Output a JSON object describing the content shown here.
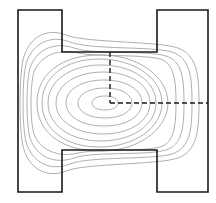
{
  "figure": {
    "title": "",
    "background_color": "#ffffff"
  },
  "domain": {
    "name": "h-shaped-specimen",
    "shape": "H",
    "outline_color": "#1a1a1a",
    "outline_width": 1.6,
    "fill_color": "#ffffff",
    "bounds": {
      "x_min": 18,
      "x_max": 208,
      "y_min": 10,
      "y_max": 192
    },
    "notch": {
      "left_arm_inner_x": 62,
      "right_arm_inner_x": 157,
      "top_notch_y": 52,
      "bottom_notch_y": 150
    },
    "outline_path": "M18,10 L62,10 L62,52 L157,52 L157,10 L208,10 L208,192 L157,192 L157,150 L62,150 L62,192 L18,192 Z"
  },
  "centerlines": {
    "name": "dashed-centerlines",
    "color": "#1a1a1a",
    "width": 1.4,
    "dash_pattern": "5,3",
    "vertical": {
      "x": 110,
      "y_start": 52,
      "y_end": 103
    },
    "horizontal": {
      "y": 103,
      "x_start": 110,
      "x_end": 208
    }
  },
  "chart_data": {
    "type": "contour",
    "title": "",
    "xlabel": "",
    "ylabel": "",
    "grid": false,
    "legend": false,
    "center": {
      "x": 105,
      "y": 103
    },
    "n_levels": 11,
    "level_values": [
      1,
      2,
      3,
      4,
      5,
      6,
      7,
      8,
      9,
      10,
      11
    ],
    "line_color": "#9a9a9a",
    "line_width": 0.8,
    "contours": [
      {
        "level": 11,
        "path": "M105,96 C113,96 118,99 118,103 C118,107 113,110 105,110 C97,110 92,107 92,103 C92,99 97,96 105,96 Z"
      },
      {
        "level": 10,
        "path": "M105,88 C122,88 132,95 132,103 C132,111 122,118 105,118 C88,118 78,111 78,103 C78,95 88,88 105,88 Z"
      },
      {
        "level": 9,
        "path": "M104,80 C127,80 142,90 142,103 C142,116 127,126 104,126 C81,126 66,116 66,103 C66,90 81,80 104,80 Z"
      },
      {
        "level": 8,
        "path": "M103,72 C130,72 150,85 150,103 C150,121 130,134 103,134 C76,134 56,121 56,103 C56,85 76,72 103,72 Z"
      },
      {
        "level": 7,
        "path": "M101,65 C132,65 156,81 156,103 C156,125 132,141 101,141 C70,141 48,125 48,103 C48,81 70,65 101,65 Z"
      },
      {
        "level": 6,
        "path": "M99,59 C134,59 162,78 162,103 C162,128 134,147 99,147 C64,147 42,128 42,103 C42,78 64,59 99,59 Z"
      },
      {
        "level": 5,
        "path": "M95,55 C136,53 168,76 168,103 C168,130 136,153 95,151 C58,149 37,130 37,103 C37,76 58,57 95,55 Z"
      },
      {
        "level": 4,
        "path": "M78,53 C58,48 40,56 34,72 C30,84 30,122 34,134 C40,150 58,158 78,153 C96,149 140,152 160,147 C174,143 176,126 176,103 C176,80 174,63 160,59 C140,54 96,57 78,53 Z"
      },
      {
        "level": 3,
        "path": "M74,48 C54,41 36,50 30,68 C26,82 26,124 30,138 C36,156 54,165 74,158 C94,151 146,156 166,150 C182,145 184,128 184,103 C184,78 182,61 166,56 C146,50 94,55 74,48 Z"
      },
      {
        "level": 2,
        "path": "M70,42 C50,34 32,44 26,64 C22,80 22,126 26,142 C32,162 50,172 70,164 C90,156 152,160 172,154 C190,148 192,130 192,103 C192,76 190,58 172,52 C152,46 90,50 70,42 Z"
      },
      {
        "level": 1,
        "path": "M66,35 C46,27 28,38 23,60 C19,78 19,128 23,146 C28,168 46,179 66,171 C86,163 158,165 178,158 C197,151 199,131 199,103 C199,75 197,55 178,48 C158,41 86,43 66,35 Z"
      }
    ]
  }
}
